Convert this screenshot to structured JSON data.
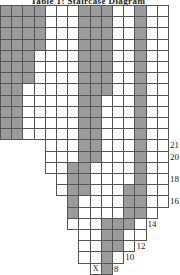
{
  "title": "Table 1: Staircase Diagram",
  "figure": {
    "name": "shaded-staircase-grid",
    "cell_size": 11.2,
    "origin_x": 0,
    "origin_y": 5,
    "fill_color": "#9b9b9b",
    "empty_color": "#ffffff",
    "border_color": "#555555",
    "mark_label": "X",
    "mark_col": 8,
    "mark_row": 23
  },
  "chart_data": {
    "type": "heatmap",
    "title": "Table 1: Staircase Diagram",
    "xlabel": "",
    "ylabel": "",
    "legend": [],
    "grid": true,
    "columns": 15,
    "rows": 24,
    "row_extents": [
      {
        "row": 0,
        "start": 0,
        "end": 14
      },
      {
        "row": 1,
        "start": 0,
        "end": 14
      },
      {
        "row": 2,
        "start": 0,
        "end": 14
      },
      {
        "row": 3,
        "start": 0,
        "end": 14
      },
      {
        "row": 4,
        "start": 0,
        "end": 14
      },
      {
        "row": 5,
        "start": 0,
        "end": 14
      },
      {
        "row": 6,
        "start": 0,
        "end": 14
      },
      {
        "row": 7,
        "start": 0,
        "end": 14
      },
      {
        "row": 8,
        "start": 0,
        "end": 14
      },
      {
        "row": 9,
        "start": 0,
        "end": 14
      },
      {
        "row": 10,
        "start": 0,
        "end": 14
      },
      {
        "row": 11,
        "start": 0,
        "end": 14
      },
      {
        "row": 12,
        "start": 4,
        "end": 14
      },
      {
        "row": 13,
        "start": 4,
        "end": 14
      },
      {
        "row": 14,
        "start": 4,
        "end": 14
      },
      {
        "row": 15,
        "start": 5,
        "end": 14
      },
      {
        "row": 16,
        "start": 5,
        "end": 14
      },
      {
        "row": 17,
        "start": 6,
        "end": 14
      },
      {
        "row": 18,
        "start": 6,
        "end": 13
      },
      {
        "row": 19,
        "start": 6,
        "end": 12
      },
      {
        "row": 20,
        "start": 7,
        "end": 12
      },
      {
        "row": 21,
        "start": 7,
        "end": 11
      },
      {
        "row": 22,
        "start": 7,
        "end": 10
      },
      {
        "row": 23,
        "start": 8,
        "end": 9
      }
    ],
    "filled_cells": [
      [
        0,
        0
      ],
      [
        0,
        1
      ],
      [
        0,
        2
      ],
      [
        0,
        3
      ],
      [
        0,
        7
      ],
      [
        0,
        8
      ],
      [
        0,
        9
      ],
      [
        0,
        12
      ],
      [
        1,
        0
      ],
      [
        1,
        1
      ],
      [
        1,
        2
      ],
      [
        1,
        3
      ],
      [
        1,
        7
      ],
      [
        1,
        8
      ],
      [
        1,
        9
      ],
      [
        1,
        12
      ],
      [
        2,
        0
      ],
      [
        2,
        1
      ],
      [
        2,
        2
      ],
      [
        2,
        3
      ],
      [
        2,
        7
      ],
      [
        2,
        8
      ],
      [
        2,
        9
      ],
      [
        2,
        12
      ],
      [
        3,
        0
      ],
      [
        3,
        1
      ],
      [
        3,
        2
      ],
      [
        3,
        3
      ],
      [
        3,
        7
      ],
      [
        3,
        8
      ],
      [
        3,
        9
      ],
      [
        3,
        12
      ],
      [
        4,
        0
      ],
      [
        4,
        1
      ],
      [
        4,
        2
      ],
      [
        4,
        7
      ],
      [
        4,
        8
      ],
      [
        4,
        9
      ],
      [
        4,
        12
      ],
      [
        5,
        0
      ],
      [
        5,
        1
      ],
      [
        5,
        2
      ],
      [
        5,
        7
      ],
      [
        5,
        8
      ],
      [
        5,
        9
      ],
      [
        5,
        12
      ],
      [
        6,
        0
      ],
      [
        6,
        1
      ],
      [
        6,
        2
      ],
      [
        6,
        7
      ],
      [
        6,
        8
      ],
      [
        6,
        9
      ],
      [
        6,
        12
      ],
      [
        7,
        0
      ],
      [
        7,
        1
      ],
      [
        7,
        7
      ],
      [
        7,
        8
      ],
      [
        7,
        9
      ],
      [
        7,
        12
      ],
      [
        8,
        0
      ],
      [
        8,
        1
      ],
      [
        8,
        7
      ],
      [
        8,
        8
      ],
      [
        8,
        12
      ],
      [
        9,
        0
      ],
      [
        9,
        1
      ],
      [
        9,
        7
      ],
      [
        9,
        8
      ],
      [
        9,
        12
      ],
      [
        10,
        0
      ],
      [
        10,
        1
      ],
      [
        10,
        7
      ],
      [
        10,
        8
      ],
      [
        10,
        12
      ],
      [
        11,
        0
      ],
      [
        11,
        1
      ],
      [
        11,
        7
      ],
      [
        11,
        8
      ],
      [
        11,
        12
      ],
      [
        12,
        7
      ],
      [
        12,
        8
      ],
      [
        12,
        12
      ],
      [
        13,
        7
      ],
      [
        13,
        8
      ],
      [
        13,
        12
      ],
      [
        14,
        6
      ],
      [
        14,
        7
      ],
      [
        14,
        12
      ],
      [
        15,
        6
      ],
      [
        15,
        7
      ],
      [
        15,
        12
      ],
      [
        16,
        6
      ],
      [
        16,
        7
      ],
      [
        16,
        11
      ],
      [
        16,
        12
      ],
      [
        17,
        6
      ],
      [
        17,
        11
      ],
      [
        17,
        12
      ],
      [
        18,
        6
      ],
      [
        18,
        11
      ],
      [
        18,
        12
      ],
      [
        19,
        9
      ],
      [
        19,
        10
      ],
      [
        19,
        11
      ],
      [
        20,
        9
      ],
      [
        20,
        10
      ],
      [
        21,
        9
      ],
      [
        21,
        10
      ],
      [
        22,
        9
      ],
      [
        23,
        9
      ]
    ],
    "row_labels": [
      {
        "value": "21",
        "row": 12
      },
      {
        "value": "20",
        "row": 13
      },
      {
        "value": "18",
        "row": 15
      },
      {
        "value": "16",
        "row": 17
      },
      {
        "value": "14",
        "row": 19
      },
      {
        "value": "12",
        "row": 21
      },
      {
        "value": "10",
        "row": 22
      },
      {
        "value": "8",
        "row": 23
      }
    ]
  }
}
